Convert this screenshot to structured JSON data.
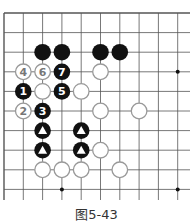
{
  "caption": "图5-43",
  "grid": {
    "x0": 4,
    "y0": 13,
    "dx": 19.3,
    "dy": 19.6,
    "cols": 10,
    "rows": 10,
    "x_end": 190,
    "y_end": 200
  },
  "colors": {
    "line": "#555555",
    "black": "#111111",
    "white_fill": "#ffffff",
    "white_stroke": "#999999"
  },
  "hoshi": [
    [
      9,
      3
    ],
    [
      3,
      9
    ],
    [
      9,
      9
    ]
  ],
  "stones": [
    {
      "c": 2,
      "r": 2,
      "color": "black",
      "label": ""
    },
    {
      "c": 3,
      "r": 2,
      "color": "black",
      "label": ""
    },
    {
      "c": 5,
      "r": 2,
      "color": "black",
      "label": ""
    },
    {
      "c": 6,
      "r": 2,
      "color": "black",
      "label": ""
    },
    {
      "c": 1,
      "r": 3,
      "color": "white",
      "label": "4"
    },
    {
      "c": 2,
      "r": 3,
      "color": "white",
      "label": "6"
    },
    {
      "c": 3,
      "r": 3,
      "color": "black",
      "label": "7"
    },
    {
      "c": 5,
      "r": 3,
      "color": "white",
      "label": ""
    },
    {
      "c": 1,
      "r": 4,
      "color": "black",
      "label": "1"
    },
    {
      "c": 2,
      "r": 4,
      "color": "white",
      "label": ""
    },
    {
      "c": 3,
      "r": 4,
      "color": "black",
      "label": "5"
    },
    {
      "c": 4,
      "r": 4,
      "color": "white",
      "label": ""
    },
    {
      "c": 1,
      "r": 5,
      "color": "white",
      "label": "2"
    },
    {
      "c": 2,
      "r": 5,
      "color": "black",
      "label": "3"
    },
    {
      "c": 5,
      "r": 5,
      "color": "white",
      "label": ""
    },
    {
      "c": 7,
      "r": 5,
      "color": "white",
      "label": ""
    },
    {
      "c": 2,
      "r": 6,
      "color": "black",
      "label": "triangle"
    },
    {
      "c": 4,
      "r": 6,
      "color": "black",
      "label": "triangle"
    },
    {
      "c": 2,
      "r": 7,
      "color": "black",
      "label": "triangle"
    },
    {
      "c": 4,
      "r": 7,
      "color": "black",
      "label": "triangle"
    },
    {
      "c": 5,
      "r": 7,
      "color": "white",
      "label": ""
    },
    {
      "c": 2,
      "r": 8,
      "color": "white",
      "label": ""
    },
    {
      "c": 3,
      "r": 8,
      "color": "white",
      "label": ""
    },
    {
      "c": 4,
      "r": 8,
      "color": "white",
      "label": ""
    },
    {
      "c": 6,
      "r": 8,
      "color": "white",
      "label": ""
    }
  ]
}
